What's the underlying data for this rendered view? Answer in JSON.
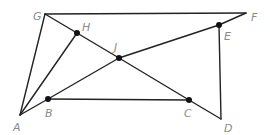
{
  "diagram": {
    "type": "geometry-figure",
    "points": [
      {
        "name": "A",
        "label": "A",
        "dot": false
      },
      {
        "name": "B",
        "label": "B",
        "dot": true
      },
      {
        "name": "C",
        "label": "C",
        "dot": true
      },
      {
        "name": "D",
        "label": "D",
        "dot": false
      },
      {
        "name": "E",
        "label": "E",
        "dot": true
      },
      {
        "name": "F",
        "label": "F",
        "dot": false
      },
      {
        "name": "G",
        "label": "G",
        "dot": false
      },
      {
        "name": "H",
        "label": "H",
        "dot": true
      },
      {
        "name": "J",
        "label": "J",
        "dot": true
      }
    ],
    "segments": [
      [
        "G",
        "F"
      ],
      [
        "G",
        "A"
      ],
      [
        "G",
        "H"
      ],
      [
        "H",
        "J"
      ],
      [
        "J",
        "C"
      ],
      [
        "C",
        "D"
      ],
      [
        "A",
        "H"
      ],
      [
        "A",
        "B"
      ],
      [
        "B",
        "J"
      ],
      [
        "J",
        "E"
      ],
      [
        "E",
        "F"
      ],
      [
        "B",
        "C"
      ],
      [
        "E",
        "D"
      ]
    ]
  }
}
